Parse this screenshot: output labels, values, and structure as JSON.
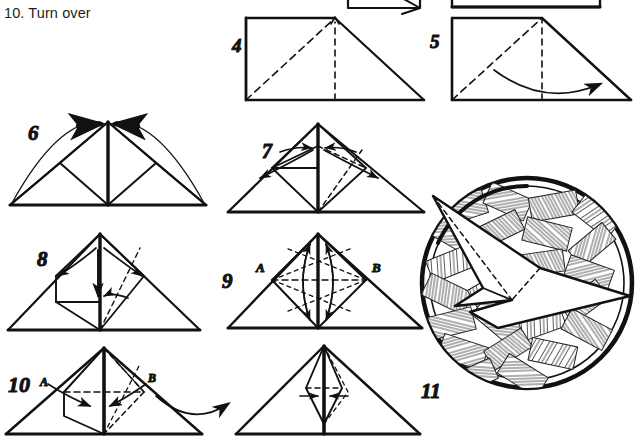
{
  "page": {
    "background_color": "#ffffff",
    "ink_color": "#111111",
    "width": 637,
    "height": 437,
    "caption": "10. Turn over",
    "document_type": "origami-instruction-diagram"
  },
  "steps": [
    {
      "id": "step-4",
      "number": "4",
      "number_pos": {
        "x": 232,
        "y": 52
      },
      "description": "Square sheet with diagonal valley fold and vertical centre crease; arrow up at apex",
      "shape": "square-with-diagonals",
      "solid_lines": [
        "left edge",
        "top edge",
        "right diagonal down"
      ],
      "dashed_lines": [
        "diagonal from bottom-left to top-centre",
        "vertical centre crease"
      ]
    },
    {
      "id": "step-5",
      "number": "5",
      "number_pos": {
        "x": 430,
        "y": 44
      },
      "description": "Square with dashed diagonals and a curved arrow sweeping from left to right across the base",
      "shape": "square-with-diagonals",
      "arrow": "curved-sweep-right"
    },
    {
      "id": "step-6",
      "number": "6",
      "number_pos": {
        "x": 28,
        "y": 133
      },
      "description": "Wide triangle with inner creases; two short solid arrows at the apex and a large arc over the top",
      "shape": "triangle-with-inner-diamond",
      "arrow": "two-apex-arrows-with-arc"
    },
    {
      "id": "step-7",
      "number": "7",
      "number_pos": {
        "x": 262,
        "y": 150
      },
      "description": "Triangle with raised inner flap; curved double arrows pointing outward left and right",
      "shape": "triangle-with-raised-flap",
      "arrow": "double-curved-outward"
    },
    {
      "id": "step-8",
      "number": "8",
      "number_pos": {
        "x": 37,
        "y": 258
      },
      "description": "Triangle with inner square flap; curved arrows out to the left and right plus a down arrow in the centre",
      "shape": "triangle-with-inner-square",
      "arrow": "outward-pair-plus-down"
    },
    {
      "id": "step-9",
      "number": "9",
      "number_pos": {
        "x": 222,
        "y": 277
      },
      "description": "Triangle with dashed horizontal fold line joining points A and B; vertical double arrows at centre",
      "shape": "triangle-with-horizontal-crease",
      "point_labels": [
        "A",
        "B"
      ],
      "arrow": "vertical-double"
    },
    {
      "id": "step-10",
      "number": "10",
      "number_pos": {
        "x": 8,
        "y": 383
      },
      "description": "Triangle with A and B marked; arrows fold inward to centre; large curved arrow leads to the result figure on the right",
      "shape": "triangle-with-inner-flaps",
      "point_labels": [
        "A",
        "B"
      ],
      "arrow": "inward-pair-plus-transition"
    },
    {
      "id": "step-10-result",
      "number": "",
      "description": "Resulting narrow triangle with slim inner diamond and small opposing arrows",
      "shape": "triangle-with-narrow-diamond",
      "arrow": "small-opposing-pair"
    },
    {
      "id": "step-11",
      "number": "11",
      "number_pos": {
        "x": 421,
        "y": 388
      },
      "description": "Finished paper bird resting inside a round woven nest drawn with cross-hatched straw texture",
      "shape": "bird-in-woven-nest",
      "labels": []
    }
  ],
  "point_labels": {
    "a": "A",
    "b": "B"
  },
  "cropped_top_figures": [
    {
      "id": "top-crop-left",
      "description": "Bottom sliver of a previous step's rectangle with an arrow, cut off by the top edge"
    },
    {
      "id": "top-crop-right",
      "description": "Bottom sliver of another previous step's rectangle, cut off by the top edge"
    }
  ]
}
